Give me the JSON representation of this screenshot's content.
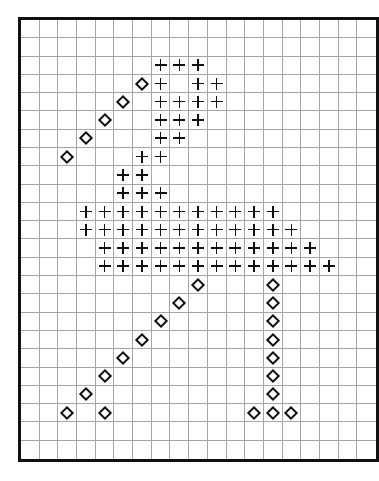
{
  "chart": {
    "title": "",
    "columns": 19,
    "rows": 24,
    "colors": {
      "border": "#111111",
      "grid_line": "#a6a6a6",
      "symbol": "#111111",
      "background": "#ffffff"
    },
    "symbols": {
      "plus": "plus-sign",
      "diamond": "open-diamond"
    }
  },
  "chart_data": {
    "type": "heatmap",
    "title": "",
    "xlabel": "",
    "ylabel": "",
    "grid": true,
    "columns": 19,
    "rows": 24,
    "legend": [],
    "cells": [
      {
        "row": 2,
        "col": 7,
        "symbol": "plus"
      },
      {
        "row": 2,
        "col": 8,
        "symbol": "plus"
      },
      {
        "row": 2,
        "col": 9,
        "symbol": "plus"
      },
      {
        "row": 3,
        "col": 6,
        "symbol": "diamond"
      },
      {
        "row": 3,
        "col": 7,
        "symbol": "plus"
      },
      {
        "row": 3,
        "col": 9,
        "symbol": "plus"
      },
      {
        "row": 3,
        "col": 10,
        "symbol": "plus"
      },
      {
        "row": 4,
        "col": 5,
        "symbol": "diamond"
      },
      {
        "row": 4,
        "col": 7,
        "symbol": "plus"
      },
      {
        "row": 4,
        "col": 8,
        "symbol": "plus"
      },
      {
        "row": 4,
        "col": 9,
        "symbol": "plus"
      },
      {
        "row": 4,
        "col": 10,
        "symbol": "plus"
      },
      {
        "row": 5,
        "col": 4,
        "symbol": "diamond"
      },
      {
        "row": 5,
        "col": 7,
        "symbol": "plus"
      },
      {
        "row": 5,
        "col": 8,
        "symbol": "plus"
      },
      {
        "row": 5,
        "col": 9,
        "symbol": "plus"
      },
      {
        "row": 6,
        "col": 3,
        "symbol": "diamond"
      },
      {
        "row": 6,
        "col": 7,
        "symbol": "plus"
      },
      {
        "row": 6,
        "col": 8,
        "symbol": "plus"
      },
      {
        "row": 7,
        "col": 2,
        "symbol": "diamond"
      },
      {
        "row": 7,
        "col": 6,
        "symbol": "plus"
      },
      {
        "row": 7,
        "col": 7,
        "symbol": "plus"
      },
      {
        "row": 8,
        "col": 5,
        "symbol": "plus"
      },
      {
        "row": 8,
        "col": 6,
        "symbol": "plus"
      },
      {
        "row": 9,
        "col": 5,
        "symbol": "plus"
      },
      {
        "row": 9,
        "col": 6,
        "symbol": "plus"
      },
      {
        "row": 9,
        "col": 7,
        "symbol": "plus"
      },
      {
        "row": 10,
        "col": 3,
        "symbol": "plus"
      },
      {
        "row": 10,
        "col": 4,
        "symbol": "plus"
      },
      {
        "row": 10,
        "col": 5,
        "symbol": "plus"
      },
      {
        "row": 10,
        "col": 6,
        "symbol": "plus"
      },
      {
        "row": 10,
        "col": 7,
        "symbol": "plus"
      },
      {
        "row": 10,
        "col": 8,
        "symbol": "plus"
      },
      {
        "row": 10,
        "col": 9,
        "symbol": "plus"
      },
      {
        "row": 10,
        "col": 10,
        "symbol": "plus"
      },
      {
        "row": 10,
        "col": 11,
        "symbol": "plus"
      },
      {
        "row": 10,
        "col": 12,
        "symbol": "plus"
      },
      {
        "row": 10,
        "col": 13,
        "symbol": "plus"
      },
      {
        "row": 11,
        "col": 3,
        "symbol": "plus"
      },
      {
        "row": 11,
        "col": 4,
        "symbol": "plus"
      },
      {
        "row": 11,
        "col": 5,
        "symbol": "plus"
      },
      {
        "row": 11,
        "col": 6,
        "symbol": "plus"
      },
      {
        "row": 11,
        "col": 7,
        "symbol": "plus"
      },
      {
        "row": 11,
        "col": 8,
        "symbol": "plus"
      },
      {
        "row": 11,
        "col": 9,
        "symbol": "plus"
      },
      {
        "row": 11,
        "col": 10,
        "symbol": "plus"
      },
      {
        "row": 11,
        "col": 11,
        "symbol": "plus"
      },
      {
        "row": 11,
        "col": 12,
        "symbol": "plus"
      },
      {
        "row": 11,
        "col": 13,
        "symbol": "plus"
      },
      {
        "row": 11,
        "col": 14,
        "symbol": "plus"
      },
      {
        "row": 12,
        "col": 4,
        "symbol": "plus"
      },
      {
        "row": 12,
        "col": 5,
        "symbol": "plus"
      },
      {
        "row": 12,
        "col": 6,
        "symbol": "plus"
      },
      {
        "row": 12,
        "col": 7,
        "symbol": "plus"
      },
      {
        "row": 12,
        "col": 8,
        "symbol": "plus"
      },
      {
        "row": 12,
        "col": 9,
        "symbol": "plus"
      },
      {
        "row": 12,
        "col": 10,
        "symbol": "plus"
      },
      {
        "row": 12,
        "col": 11,
        "symbol": "plus"
      },
      {
        "row": 12,
        "col": 12,
        "symbol": "plus"
      },
      {
        "row": 12,
        "col": 13,
        "symbol": "plus"
      },
      {
        "row": 12,
        "col": 14,
        "symbol": "plus"
      },
      {
        "row": 12,
        "col": 15,
        "symbol": "plus"
      },
      {
        "row": 13,
        "col": 4,
        "symbol": "plus"
      },
      {
        "row": 13,
        "col": 5,
        "symbol": "plus"
      },
      {
        "row": 13,
        "col": 6,
        "symbol": "plus"
      },
      {
        "row": 13,
        "col": 7,
        "symbol": "plus"
      },
      {
        "row": 13,
        "col": 8,
        "symbol": "plus"
      },
      {
        "row": 13,
        "col": 9,
        "symbol": "plus"
      },
      {
        "row": 13,
        "col": 10,
        "symbol": "plus"
      },
      {
        "row": 13,
        "col": 11,
        "symbol": "plus"
      },
      {
        "row": 13,
        "col": 12,
        "symbol": "plus"
      },
      {
        "row": 13,
        "col": 13,
        "symbol": "plus"
      },
      {
        "row": 13,
        "col": 14,
        "symbol": "plus"
      },
      {
        "row": 13,
        "col": 15,
        "symbol": "plus"
      },
      {
        "row": 13,
        "col": 16,
        "symbol": "plus"
      },
      {
        "row": 14,
        "col": 9,
        "symbol": "diamond"
      },
      {
        "row": 14,
        "col": 13,
        "symbol": "diamond"
      },
      {
        "row": 15,
        "col": 8,
        "symbol": "diamond"
      },
      {
        "row": 15,
        "col": 13,
        "symbol": "diamond"
      },
      {
        "row": 16,
        "col": 7,
        "symbol": "diamond"
      },
      {
        "row": 16,
        "col": 13,
        "symbol": "diamond"
      },
      {
        "row": 17,
        "col": 6,
        "symbol": "diamond"
      },
      {
        "row": 17,
        "col": 13,
        "symbol": "diamond"
      },
      {
        "row": 18,
        "col": 5,
        "symbol": "diamond"
      },
      {
        "row": 18,
        "col": 13,
        "symbol": "diamond"
      },
      {
        "row": 19,
        "col": 4,
        "symbol": "diamond"
      },
      {
        "row": 19,
        "col": 13,
        "symbol": "diamond"
      },
      {
        "row": 20,
        "col": 3,
        "symbol": "diamond"
      },
      {
        "row": 20,
        "col": 13,
        "symbol": "diamond"
      },
      {
        "row": 21,
        "col": 2,
        "symbol": "diamond"
      },
      {
        "row": 21,
        "col": 4,
        "symbol": "diamond"
      },
      {
        "row": 21,
        "col": 12,
        "symbol": "diamond"
      },
      {
        "row": 21,
        "col": 13,
        "symbol": "diamond"
      },
      {
        "row": 21,
        "col": 14,
        "symbol": "diamond"
      }
    ]
  }
}
